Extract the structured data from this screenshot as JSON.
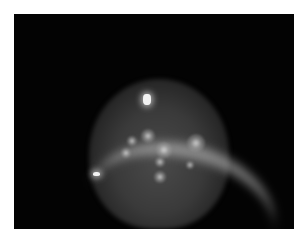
{
  "image": {
    "description": "Grayscale circular illuminated field on black background with several bright diffuse spots, a curved bright band in the lower portion, and a small bright glare point at the top",
    "background_color": "#ffffff",
    "frame_color": "#030303",
    "spots": [
      {
        "x": 148,
        "y": 136,
        "r": 7
      },
      {
        "x": 132,
        "y": 141,
        "r": 5
      },
      {
        "x": 126,
        "y": 153,
        "r": 5
      },
      {
        "x": 164,
        "y": 150,
        "r": 8
      },
      {
        "x": 196,
        "y": 143,
        "r": 9
      },
      {
        "x": 160,
        "y": 162,
        "r": 5
      },
      {
        "x": 190,
        "y": 165,
        "r": 4
      },
      {
        "x": 160,
        "y": 177,
        "r": 6
      }
    ],
    "glare_top": {
      "x": 143,
      "y": 94,
      "w": 8,
      "h": 11
    },
    "glare_left": {
      "x": 93,
      "y": 172,
      "w": 7,
      "h": 4
    }
  }
}
